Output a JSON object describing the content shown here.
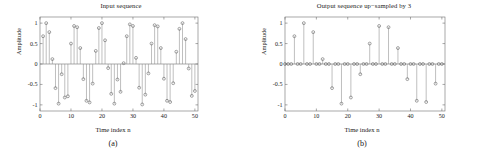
{
  "figure": {
    "panels": [
      {
        "id": "panel-a",
        "caption": "(a)",
        "title": "Input sequence",
        "xlabel": "Time index n",
        "ylabel": "Amplitude",
        "xticks": [
          "0",
          "10",
          "20",
          "30",
          "40",
          "50"
        ],
        "yticks": [
          "1",
          "0.5",
          "0",
          "-0.5",
          "-1"
        ]
      },
      {
        "id": "panel-b",
        "caption": "(b)",
        "title": "Output sequence up−sampled by 3",
        "xlabel": "Time index n",
        "ylabel": "Amplitude",
        "xticks": [
          "0",
          "10",
          "20",
          "30",
          "40",
          "50"
        ],
        "yticks": [
          "1",
          "0.5",
          "0",
          "-0.5",
          "-1"
        ]
      }
    ]
  },
  "chart_data": [
    {
      "type": "scatter",
      "plot_style": "stem",
      "title": "Input sequence",
      "xlabel": "Time index n",
      "ylabel": "Amplitude",
      "xlim": [
        0,
        51
      ],
      "ylim": [
        -1.15,
        1.15
      ],
      "xticks": [
        0,
        10,
        20,
        30,
        40,
        50
      ],
      "yticks": [
        -1,
        -0.5,
        0,
        0.5,
        1
      ],
      "grid": false,
      "legend": null,
      "marker": "circle-open",
      "x": [
        1,
        2,
        3,
        4,
        5,
        6,
        7,
        8,
        9,
        10,
        11,
        12,
        13,
        14,
        15,
        16,
        17,
        18,
        19,
        20,
        21,
        22,
        23,
        24,
        25,
        26,
        27,
        28,
        29,
        30,
        31,
        32,
        33,
        34,
        35,
        36,
        37,
        38,
        39,
        40,
        41,
        42,
        43,
        44,
        45,
        46,
        47,
        48,
        49,
        50
      ],
      "y": [
        0.68,
        1.0,
        0.78,
        0.12,
        -0.59,
        -0.97,
        -0.25,
        -0.82,
        -0.79,
        0.5,
        0.93,
        0.9,
        0.39,
        -0.37,
        -0.9,
        -0.94,
        -0.48,
        0.32,
        0.88,
        1.0,
        0.58,
        -0.1,
        -0.73,
        -0.97,
        -0.38,
        -0.68,
        0.02,
        0.68,
        0.97,
        0.93,
        0.15,
        -0.58,
        -0.99,
        -0.75,
        -0.23,
        0.5,
        0.95,
        0.92,
        0.39,
        -0.36,
        -0.9,
        -0.93,
        -0.47,
        0.3,
        0.86,
        1.0,
        0.61,
        -0.11,
        -0.78,
        -0.66
      ]
    },
    {
      "type": "scatter",
      "plot_style": "stem",
      "title": "Output sequence up−sampled by 3",
      "xlabel": "Time index n",
      "ylabel": "Amplitude",
      "xlim": [
        0,
        51
      ],
      "ylim": [
        -1.15,
        1.15
      ],
      "xticks": [
        0,
        10,
        20,
        30,
        40,
        50
      ],
      "yticks": [
        -1,
        -0.5,
        0,
        0.5,
        1
      ],
      "grid": false,
      "legend": null,
      "marker": "circle-open",
      "upsample_factor": 3,
      "x": [
        0,
        1,
        2,
        3,
        4,
        5,
        6,
        7,
        8,
        9,
        10,
        11,
        12,
        13,
        14,
        15,
        16,
        17,
        18,
        19,
        20,
        21,
        22,
        23,
        24,
        25,
        26,
        27,
        28,
        29,
        30,
        31,
        32,
        33,
        34,
        35,
        36,
        37,
        38,
        39,
        40,
        41,
        42,
        43,
        44,
        45,
        46,
        47,
        48,
        49,
        50
      ],
      "y": [
        0,
        0,
        0,
        0.68,
        0,
        0,
        1.0,
        0,
        0,
        0.78,
        0,
        0,
        0.12,
        0,
        0,
        -0.59,
        0,
        0,
        -0.97,
        0,
        0,
        -0.82,
        0,
        0,
        -0.25,
        0,
        0,
        0.5,
        0,
        0,
        0.93,
        0,
        0,
        0.9,
        0,
        0,
        0.39,
        0,
        0,
        -0.37,
        0,
        0,
        -0.9,
        0,
        0,
        -0.93,
        0,
        0,
        -0.48,
        0,
        0
      ]
    }
  ]
}
